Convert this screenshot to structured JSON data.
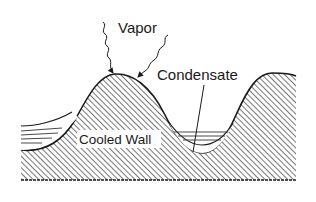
{
  "diagram": {
    "labels": {
      "vapor": "Vapor",
      "condensate": "Condensate",
      "cooled_wall": "Cooled Wall"
    },
    "colors": {
      "line": "#1a1a1a",
      "hatch": "#555555",
      "background": "#ffffff"
    }
  }
}
